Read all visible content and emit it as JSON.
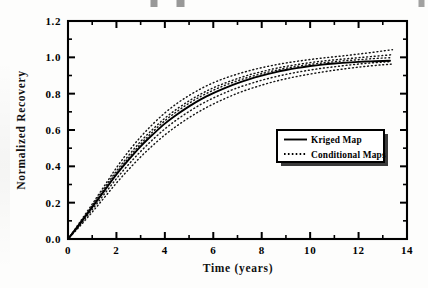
{
  "figure": {
    "name": "normalized-recovery-vs-time",
    "background_color": "#fdfdfc",
    "ink_color": "#000000"
  },
  "chart_data": {
    "type": "line",
    "title": "",
    "xlabel": "Time  (years)",
    "ylabel": "Normalized  Recovery",
    "xlim": [
      0,
      14
    ],
    "ylim": [
      0.0,
      1.2
    ],
    "xticks": [
      0,
      2,
      4,
      6,
      8,
      10,
      12,
      14
    ],
    "xtick_labels": [
      "0",
      "2",
      "4",
      "6",
      "8",
      "10",
      "12",
      "14"
    ],
    "x_minor_ticks": [
      1,
      3,
      5,
      7,
      9,
      11,
      13
    ],
    "yticks": [
      0.0,
      0.2,
      0.4,
      0.6,
      0.8,
      1.0,
      1.2
    ],
    "ytick_labels": [
      "0.0",
      "0.2",
      "0.4",
      "0.6",
      "0.8",
      "1.0",
      "1.2"
    ],
    "y_minor_ticks": [
      0.1,
      0.3,
      0.5,
      0.7,
      0.9,
      1.1
    ],
    "grid": false,
    "frame": "box-all-sides-inward-ticks",
    "legend": {
      "position": "center-right",
      "entries": [
        {
          "label": "Kriged Map",
          "style": "solid"
        },
        {
          "label": "Conditional Maps",
          "style": "dotted"
        }
      ]
    },
    "series": [
      {
        "name": "Kriged Map",
        "style": "solid",
        "x": [
          0.0,
          0.5,
          1.0,
          1.5,
          2.0,
          2.5,
          3.0,
          3.5,
          4.0,
          4.5,
          5.0,
          5.5,
          6.0,
          6.5,
          7.0,
          7.5,
          8.0,
          8.5,
          9.0,
          9.5,
          10.0,
          10.5,
          11.0,
          11.5,
          12.0,
          12.5,
          13.0,
          13.3
        ],
        "y": [
          0.0,
          0.085,
          0.175,
          0.265,
          0.355,
          0.435,
          0.51,
          0.575,
          0.635,
          0.685,
          0.73,
          0.77,
          0.803,
          0.832,
          0.858,
          0.88,
          0.899,
          0.916,
          0.93,
          0.942,
          0.952,
          0.96,
          0.966,
          0.971,
          0.975,
          0.978,
          0.98,
          0.981
        ]
      },
      {
        "name": "Conditional Maps (upper envelope)",
        "style": "dotted",
        "x": [
          0.0,
          0.5,
          1.0,
          1.5,
          2.0,
          2.5,
          3.0,
          3.5,
          4.0,
          4.5,
          5.0,
          5.5,
          6.0,
          6.5,
          7.0,
          7.5,
          8.0,
          8.5,
          9.0,
          9.5,
          10.0,
          10.5,
          11.0,
          11.5,
          12.0,
          12.5,
          13.0,
          13.4
        ],
        "y": [
          0.0,
          0.095,
          0.192,
          0.292,
          0.392,
          0.482,
          0.562,
          0.632,
          0.694,
          0.746,
          0.79,
          0.828,
          0.86,
          0.886,
          0.908,
          0.927,
          0.943,
          0.957,
          0.969,
          0.979,
          0.988,
          0.996,
          1.003,
          1.01,
          1.018,
          1.026,
          1.035,
          1.042
        ]
      },
      {
        "name": "Conditional Maps (lower envelope)",
        "style": "dotted",
        "x": [
          0.0,
          0.5,
          1.0,
          1.5,
          2.0,
          2.5,
          3.0,
          3.5,
          4.0,
          4.5,
          5.0,
          5.5,
          6.0,
          6.5,
          7.0,
          7.5,
          8.0,
          8.5,
          9.0,
          9.5,
          10.0,
          10.5,
          11.0,
          11.5,
          12.0,
          12.5,
          13.0,
          13.4
        ],
        "y": [
          0.0,
          0.072,
          0.148,
          0.228,
          0.308,
          0.382,
          0.452,
          0.515,
          0.573,
          0.623,
          0.668,
          0.708,
          0.743,
          0.774,
          0.802,
          0.826,
          0.847,
          0.866,
          0.882,
          0.896,
          0.908,
          0.919,
          0.929,
          0.938,
          0.946,
          0.953,
          0.959,
          0.963
        ]
      },
      {
        "name": "Conditional Maps (inner band a)",
        "style": "dotted",
        "x": [
          0.0,
          0.5,
          1.0,
          1.5,
          2.0,
          2.5,
          3.0,
          3.5,
          4.0,
          4.5,
          5.0,
          5.5,
          6.0,
          6.5,
          7.0,
          7.5,
          8.0,
          8.5,
          9.0,
          9.5,
          10.0,
          10.5,
          11.0,
          11.5,
          12.0,
          12.5,
          13.0,
          13.35
        ],
        "y": [
          0.0,
          0.09,
          0.184,
          0.28,
          0.374,
          0.459,
          0.537,
          0.604,
          0.665,
          0.716,
          0.76,
          0.799,
          0.832,
          0.859,
          0.883,
          0.904,
          0.921,
          0.937,
          0.95,
          0.961,
          0.971,
          0.979,
          0.986,
          0.992,
          0.998,
          1.004,
          1.01,
          1.014
        ]
      },
      {
        "name": "Conditional Maps (inner band b)",
        "style": "dotted",
        "x": [
          0.0,
          0.5,
          1.0,
          1.5,
          2.0,
          2.5,
          3.0,
          3.5,
          4.0,
          4.5,
          5.0,
          5.5,
          6.0,
          6.5,
          7.0,
          7.5,
          8.0,
          8.5,
          9.0,
          9.5,
          10.0,
          10.5,
          11.0,
          11.5,
          12.0,
          12.5,
          13.0,
          13.35
        ],
        "y": [
          0.0,
          0.079,
          0.162,
          0.247,
          0.332,
          0.41,
          0.482,
          0.547,
          0.606,
          0.657,
          0.702,
          0.742,
          0.776,
          0.806,
          0.832,
          0.854,
          0.874,
          0.891,
          0.906,
          0.919,
          0.93,
          0.94,
          0.948,
          0.956,
          0.963,
          0.969,
          0.974,
          0.977
        ]
      },
      {
        "name": "Conditional Maps (inner band c)",
        "style": "dotted",
        "x": [
          0.0,
          0.5,
          1.0,
          1.5,
          2.0,
          2.5,
          3.0,
          3.5,
          4.0,
          4.5,
          5.0,
          5.5,
          6.0,
          6.5,
          7.0,
          7.5,
          8.0,
          8.5,
          9.0,
          9.5,
          10.0,
          10.5,
          11.0,
          11.5,
          12.0,
          12.5,
          13.0,
          13.3
        ],
        "y": [
          0.0,
          0.087,
          0.178,
          0.271,
          0.363,
          0.446,
          0.523,
          0.59,
          0.651,
          0.702,
          0.747,
          0.786,
          0.819,
          0.847,
          0.871,
          0.892,
          0.91,
          0.926,
          0.94,
          0.951,
          0.961,
          0.969,
          0.976,
          0.982,
          0.987,
          0.992,
          0.996,
          0.998
        ]
      }
    ]
  }
}
